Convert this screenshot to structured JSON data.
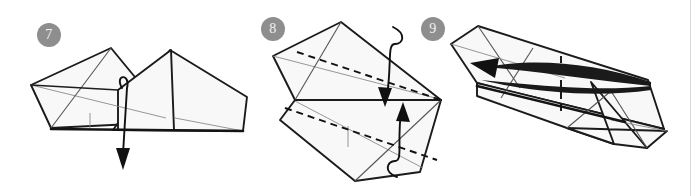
{
  "document": {
    "type": "origami-instruction-diagram",
    "title": "Origami folding steps 7 to 9",
    "background_color": "#ffffff",
    "width": 697,
    "height": 196
  },
  "style": {
    "badge_fill": "#8e8e8e",
    "badge_text_color": "#f2f2f2",
    "paper_fill": "#f8f8f8",
    "outline_color": "#1b1b1b",
    "crease_color": "#8b8b8b",
    "fold_line_color": "#111111",
    "divider_color": "#d8d8d8"
  },
  "steps": [
    {
      "number": "7",
      "badge_label": "7",
      "name": "step-7",
      "description": "Folded paper form viewed at an angle with a wrap-around arrow curling over the near flap and pointing downward.",
      "arrows": [
        {
          "name": "wrap-down-arrow",
          "direction": "down",
          "style": "looped-wrap"
        }
      ],
      "fold_lines": []
    },
    {
      "number": "8",
      "badge_label": "8",
      "name": "step-8",
      "description": "Symmetric diamond shape seen from the side with two dashed valley fold lines and two curved arrows converging at the center.",
      "arrows": [
        {
          "name": "fold-down-arrow",
          "direction": "down",
          "style": "curved"
        },
        {
          "name": "fold-up-arrow",
          "direction": "up",
          "style": "curved"
        }
      ],
      "fold_lines": [
        {
          "name": "upper-dashed-fold",
          "type": "dashed"
        },
        {
          "name": "lower-dashed-fold",
          "type": "dashed"
        }
      ]
    },
    {
      "number": "9",
      "badge_label": "9",
      "name": "step-9",
      "description": "Elongated narrow form rotated diagonally with a vertical dashed fold line and a long flat lens-shaped arrow pointing left.",
      "arrows": [
        {
          "name": "rotate-left-arrow",
          "direction": "left",
          "style": "flat-lens"
        }
      ],
      "fold_lines": [
        {
          "name": "vertical-dashed-fold",
          "type": "dashed"
        }
      ]
    }
  ]
}
